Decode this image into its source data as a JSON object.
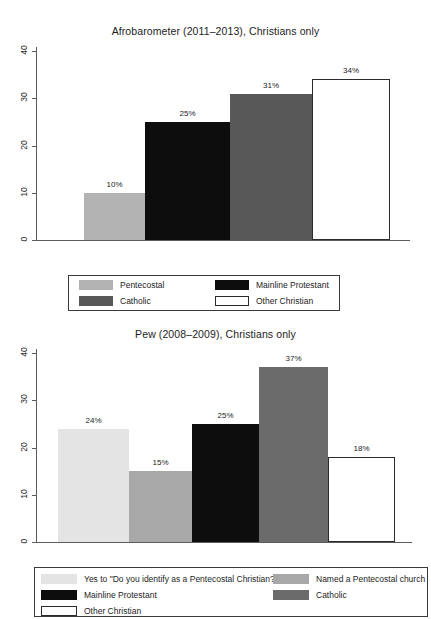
{
  "charts": [
    {
      "id": "afrobarometer",
      "title": "Afrobarometer (2011–2013), Christians only",
      "y_ticks": [
        "0",
        "10",
        "20",
        "30",
        "40"
      ],
      "bars": [
        {
          "label": "10%",
          "value": 10,
          "color": "#b3b3b3",
          "category": "Pentecostal"
        },
        {
          "label": "25%",
          "value": 25,
          "color": "#0d0d0d",
          "category": "Mainline Protestant"
        },
        {
          "label": "31%",
          "value": 31,
          "color": "#585858",
          "category": "Catholic"
        },
        {
          "label": "34%",
          "value": 34,
          "color": "#ffffff",
          "category": "Other Christian"
        }
      ],
      "legend": [
        {
          "label": "Pentecostal",
          "color": "#b3b3b3"
        },
        {
          "label": "Mainline Protestant",
          "color": "#0d0d0d"
        },
        {
          "label": "Catholic",
          "color": "#585858"
        },
        {
          "label": "Other Christian",
          "color": "#ffffff"
        }
      ]
    },
    {
      "id": "pew",
      "title": "Pew (2008–2009), Christians only",
      "y_ticks": [
        "0",
        "10",
        "20",
        "30",
        "40"
      ],
      "bars": [
        {
          "label": "24%",
          "value": 24,
          "color": "#e4e4e4",
          "category": "Yes to \"Do you identify as a Pentecostal Christian?\""
        },
        {
          "label": "15%",
          "value": 15,
          "color": "#a8a8a8",
          "category": "Named a Pentecostal church"
        },
        {
          "label": "25%",
          "value": 25,
          "color": "#0d0d0d",
          "category": "Mainline Protestant"
        },
        {
          "label": "37%",
          "value": 37,
          "color": "#6b6b6b",
          "category": "Catholic"
        },
        {
          "label": "18%",
          "value": 18,
          "color": "#ffffff",
          "category": "Other Christian"
        }
      ],
      "legend": [
        {
          "label": "Yes to \"Do you identify as a Pentecostal Christian?\"",
          "color": "#e4e4e4"
        },
        {
          "label": "Named a Pentecostal  church",
          "color": "#a8a8a8"
        },
        {
          "label": "Mainline Protestant",
          "color": "#0d0d0d"
        },
        {
          "label": "Catholic",
          "color": "#6b6b6b"
        },
        {
          "label": "Other Christian",
          "color": "#ffffff"
        }
      ]
    }
  ],
  "chart_data": [
    {
      "type": "bar",
      "title": "Afrobarometer (2011–2013), Christians only",
      "categories": [
        "Pentecostal",
        "Mainline Protestant",
        "Catholic",
        "Other Christian"
      ],
      "values": [
        10,
        25,
        31,
        34
      ],
      "data_labels": [
        "10%",
        "25%",
        "31%",
        "34%"
      ],
      "xlabel": "",
      "ylabel": "",
      "ylim": [
        0,
        42
      ],
      "yticks": [
        0,
        10,
        20,
        30,
        40
      ],
      "grid": false,
      "legend_position": "bottom",
      "series_colors": [
        "#b3b3b3",
        "#0d0d0d",
        "#585858",
        "#ffffff"
      ]
    },
    {
      "type": "bar",
      "title": "Pew (2008–2009), Christians only",
      "categories": [
        "Yes to \"Do you identify as a Pentecostal Christian?\"",
        "Named a Pentecostal  church",
        "Mainline Protestant",
        "Catholic",
        "Other Christian"
      ],
      "values": [
        24,
        15,
        25,
        37,
        18
      ],
      "data_labels": [
        "24%",
        "15%",
        "25%",
        "37%",
        "18%"
      ],
      "xlabel": "",
      "ylabel": "",
      "ylim": [
        0,
        42
      ],
      "yticks": [
        0,
        10,
        20,
        30,
        40
      ],
      "grid": false,
      "legend_position": "bottom",
      "series_colors": [
        "#e4e4e4",
        "#a8a8a8",
        "#0d0d0d",
        "#6b6b6b",
        "#ffffff"
      ]
    }
  ]
}
